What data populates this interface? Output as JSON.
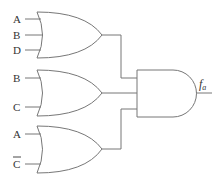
{
  "diagram": {
    "type": "logic-circuit",
    "colors": {
      "stroke": "#777777",
      "text": "#333333",
      "background": "#ffffff"
    },
    "gates": [
      {
        "id": "or1",
        "type": "OR",
        "inputs": [
          "A",
          "B",
          "D"
        ]
      },
      {
        "id": "or2",
        "type": "OR",
        "inputs": [
          "B",
          "C"
        ]
      },
      {
        "id": "or3",
        "type": "OR",
        "inputs": [
          "A",
          "C̄"
        ]
      },
      {
        "id": "and1",
        "type": "AND",
        "inputs": [
          "or1",
          "or2",
          "or3"
        ]
      }
    ],
    "input_labels": {
      "g1_a": "A",
      "g1_b": "B",
      "g1_d": "D",
      "g2_b": "B",
      "g2_c": "C",
      "g3_a": "A",
      "g3_c": "C"
    },
    "g3_c_complemented": true,
    "output": {
      "name": "f",
      "subscript": "a"
    }
  }
}
